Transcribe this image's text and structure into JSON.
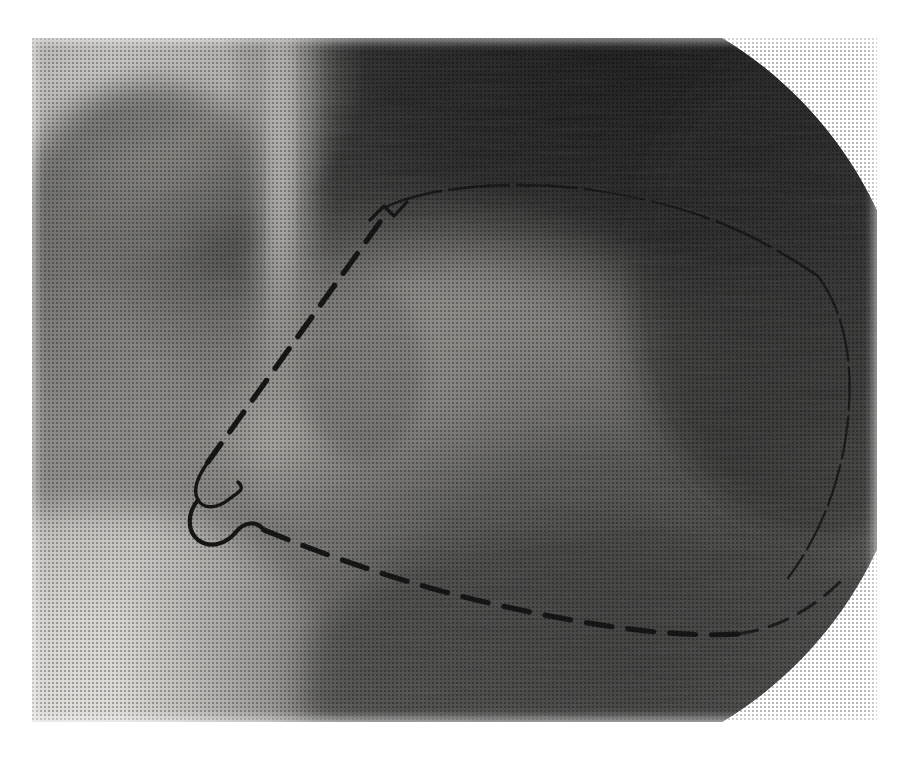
{
  "figure": {
    "kind": "radiograph",
    "modality": "contrast left ventriculogram (fluoroscopic still)",
    "caption_remnant": "",
    "plate": {
      "x": 32,
      "y": 38,
      "width": 845,
      "height": 684,
      "background_color": "#8d8d8d",
      "paper_color": "#ffffff"
    },
    "tones": {
      "highlight": "#e7e5e1",
      "light_gray": "#c9c7c3",
      "mid_gray": "#9a9894",
      "dark_gray": "#5e5d5b",
      "deep_shadow": "#2c2c2b",
      "near_black": "#141414",
      "tracing_ink": "#0d0d0d"
    },
    "regions": [
      {
        "name": "upper-left-soft-tissue",
        "tone": "light_gray",
        "note": "bright diaphragm / lung field"
      },
      {
        "name": "vertical-bright-band",
        "tone": "highlight",
        "note": "spine-catheter bright column, x 255-295"
      },
      {
        "name": "upper-right-dark-field",
        "tone": "near_black",
        "note": "collimated dark background"
      },
      {
        "name": "central-contrast-pool",
        "tone": "mid_gray",
        "note": "opacified ventricular cavity"
      },
      {
        "name": "lower-left-bright-field",
        "tone": "light_gray",
        "note": "bright lower-left corner"
      },
      {
        "name": "lower-right-dark-field",
        "tone": "deep_shadow",
        "note": "dark inferior field"
      }
    ],
    "collimation": {
      "shape": "circle",
      "corners_cut": [
        "top-right",
        "bottom-right"
      ],
      "outside_tone": "#ffffff"
    },
    "tracing": {
      "label": "hand-drawn dashed contour outlining the ventricular silhouette",
      "style": "dashed",
      "ink_color": "#0d0d0d",
      "stroke_width_px": 5,
      "dash_pattern": "22 13",
      "segments": [
        {
          "name": "superior-rim",
          "style": "thin-solid",
          "stroke_width_px": 2
        },
        {
          "name": "anterior-wall",
          "style": "dashed"
        },
        {
          "name": "apical-notch",
          "style": "thin-solid",
          "stroke_width_px": 3
        },
        {
          "name": "inferior-wall",
          "style": "dashed"
        },
        {
          "name": "posterior-rim",
          "style": "thin-solid",
          "stroke_width_px": 2
        }
      ],
      "landmarks": {
        "superior-apex": {
          "x": 383,
          "y": 207
        },
        "anterior-notch": {
          "x": 205,
          "y": 462
        },
        "inferior-hook": {
          "x": 232,
          "y": 497
        },
        "inferior-nadir": {
          "x": 690,
          "y": 640
        },
        "posterior-shoulder": {
          "x": 846,
          "y": 408
        }
      }
    }
  }
}
